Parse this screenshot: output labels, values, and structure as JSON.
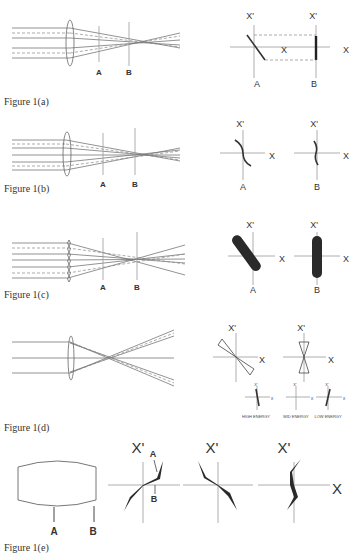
{
  "figures": [
    {
      "id": "1a",
      "caption": "Figure 1(a)",
      "plane_labels": [
        "A",
        "B"
      ],
      "phase_plots": [
        {
          "x_label": "X",
          "xp_label": "X'",
          "plane": "A"
        },
        {
          "x_label": "X",
          "xp_label": "X'",
          "plane": "B"
        }
      ]
    },
    {
      "id": "1b",
      "caption": "Figure 1(b)",
      "plane_labels": [
        "A",
        "B"
      ],
      "phase_plots": [
        {
          "x_label": "X",
          "xp_label": "X'",
          "plane": "A"
        },
        {
          "x_label": "X",
          "xp_label": "X'",
          "plane": "B"
        }
      ]
    },
    {
      "id": "1c",
      "caption": "Figure 1(c)",
      "plane_labels": [
        "A",
        "B"
      ],
      "phase_plots": [
        {
          "x_label": "X",
          "xp_label": "X'",
          "plane": "A"
        },
        {
          "x_label": "X",
          "xp_label": "X'",
          "plane": "B"
        }
      ]
    },
    {
      "id": "1d",
      "caption": "Figure 1(d)",
      "phase_plots": [
        {
          "x_label": "X",
          "xp_label": "X'"
        },
        {
          "x_label": "X",
          "xp_label": "X'"
        }
      ],
      "energy_plots": [
        {
          "label": "HIGH ENERGY",
          "x_label": "X",
          "xp_label": "X'"
        },
        {
          "label": "MID ENERGY",
          "x_label": "X",
          "xp_label": "X'"
        },
        {
          "label": "LOW ENERGY",
          "x_label": "X",
          "xp_label": "X'"
        }
      ]
    },
    {
      "id": "1e",
      "caption": "Figure 1(e)",
      "plane_labels": [
        "A",
        "B"
      ],
      "phase_plots": [
        {
          "xp_label": "X'",
          "annotations": [
            "A",
            "B"
          ]
        },
        {
          "xp_label": "X'"
        },
        {
          "xp_label": "X'",
          "x_label": "X"
        }
      ]
    }
  ]
}
